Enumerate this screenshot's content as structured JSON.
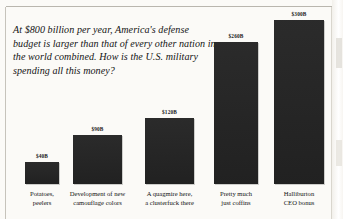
{
  "page": {
    "intro_paragraph": "At $800 billion per year, America's defense budget is larger than that of every other nation in the world combined. How is the U.S. military spending all this money?"
  },
  "chart_data": {
    "type": "bar",
    "title": "",
    "subtitle": "",
    "xlabel": "",
    "ylabel": "",
    "grid": false,
    "legend": null,
    "ylim": [
      0,
      300
    ],
    "unit": "billions of USD",
    "categories": [
      "Potatoes, peelers",
      "Development of new camouflage colors",
      "A quagmire here, a clusterfuck there",
      "Pretty much just coffins",
      "Halliburton CEO bonus"
    ],
    "category_lines": [
      [
        "Potatoes,",
        "peelers"
      ],
      [
        "Development of new",
        "camouflage colors"
      ],
      [
        "A quagmire here,",
        "a clusterfuck there"
      ],
      [
        "Pretty much",
        "just coffins"
      ],
      [
        "Halliburton",
        "CEO bonus"
      ]
    ],
    "values": [
      40,
      90,
      120,
      260,
      300
    ],
    "value_labels": [
      "$40B",
      "$90B",
      "$120B",
      "$260B",
      "$300B"
    ],
    "bar_color": "#232323",
    "background_color": "#fbfaf7"
  }
}
